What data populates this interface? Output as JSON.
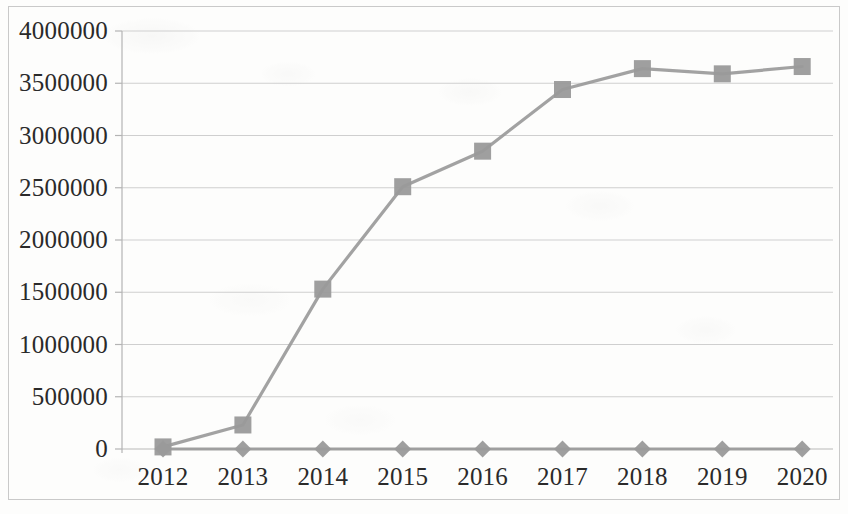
{
  "chart_data": {
    "type": "line",
    "title": "",
    "subtitle": "",
    "xlabel": "",
    "ylabel": "",
    "categories": [
      "2012",
      "2013",
      "2014",
      "2015",
      "2016",
      "2017",
      "2018",
      "2019",
      "2020"
    ],
    "x": [
      2012,
      2013,
      2014,
      2015,
      2016,
      2017,
      2018,
      2019,
      2020
    ],
    "series": [
      {
        "name": "Series 1",
        "marker": "square",
        "color": "#9a9a9a",
        "values": [
          20000,
          230000,
          1530000,
          2510000,
          2850000,
          3440000,
          3640000,
          3590000,
          3660000
        ]
      },
      {
        "name": "Series 2",
        "marker": "diamond",
        "color": "#9a9a9a",
        "values": [
          0,
          0,
          0,
          0,
          0,
          0,
          0,
          0,
          0
        ]
      }
    ],
    "ylim": [
      0,
      4000000
    ],
    "yticks": [
      0,
      500000,
      1000000,
      1500000,
      2000000,
      2500000,
      3000000,
      3500000,
      4000000
    ],
    "ytick_labels": [
      "0",
      "500000",
      "1000000",
      "1500000",
      "2000000",
      "2500000",
      "3000000",
      "3500000",
      "4000000"
    ],
    "xtick_labels": [
      "2012",
      "2013",
      "2014",
      "2015",
      "2016",
      "2017",
      "2018",
      "2019",
      "2020"
    ],
    "grid": true,
    "grid_axis": "y",
    "legend": false,
    "legend_position": "none",
    "colors": {
      "line": "#9a9a9a",
      "marker": "#9a9a9a",
      "grid": "#cfcfcf",
      "axis": "#b4b4b4",
      "text": "#2a2a2a",
      "frame": "#c9c9c9",
      "background": "#fdfdfc"
    }
  }
}
